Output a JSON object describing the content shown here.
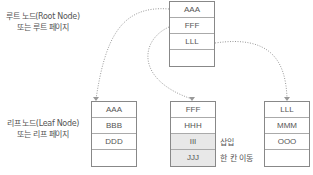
{
  "labels": {
    "root": [
      "루트 노드(Root Node)",
      "또는 루트 페이지"
    ],
    "leaf": [
      "리프 노드(Leaf Node)",
      "또는 리프 페이지"
    ]
  },
  "root_node": {
    "rows": [
      "AAA",
      "FFF",
      "LLL",
      ""
    ]
  },
  "leaf_nodes": [
    {
      "rows": [
        "AAA",
        "BBB",
        "DDD",
        ""
      ]
    },
    {
      "rows": [
        "FFF",
        "HHH",
        "III",
        "JJJ"
      ]
    },
    {
      "rows": [
        "LLL",
        "MMM",
        "OOO",
        ""
      ]
    }
  ],
  "annotations": {
    "insert": "삽입",
    "shift": "한 칸 이동"
  },
  "colors": {
    "border": "#888888",
    "highlight": "#e8e8e8",
    "link": "#999999"
  }
}
